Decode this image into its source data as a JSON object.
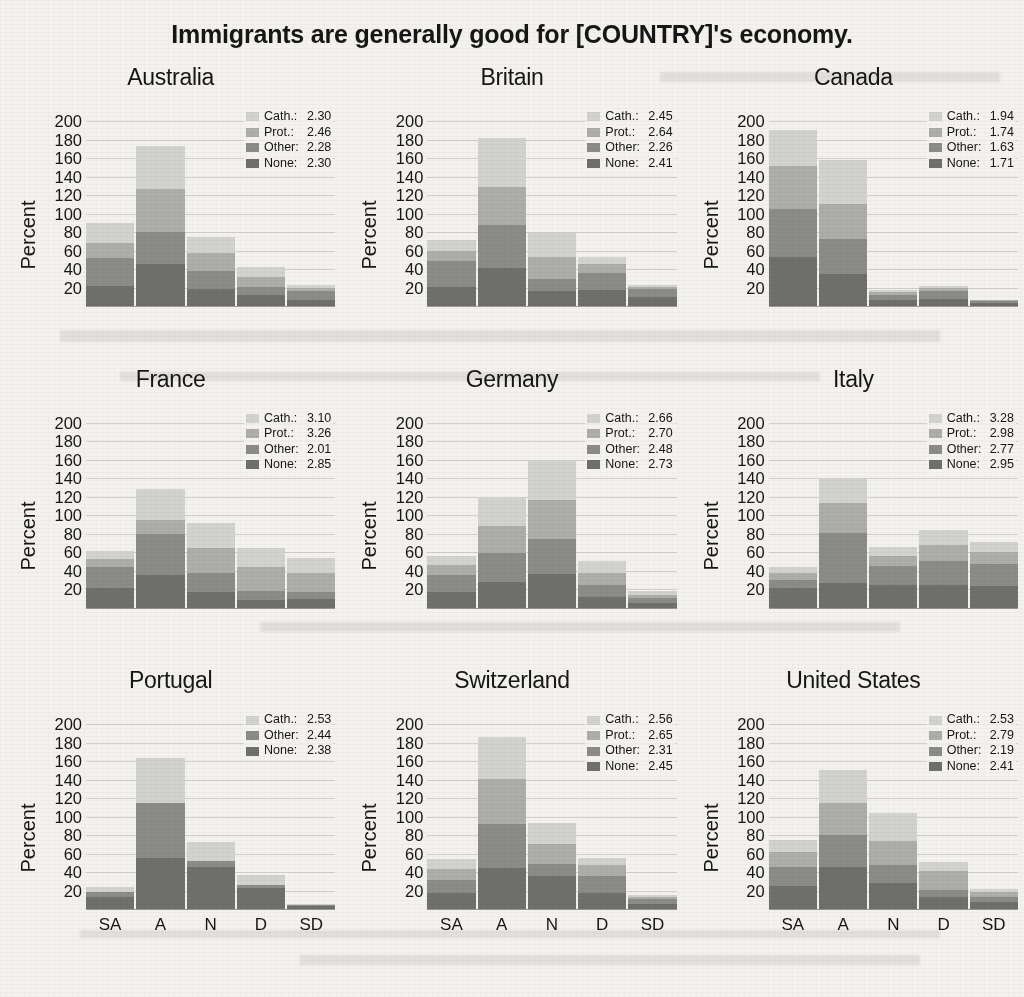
{
  "title": "Immigrants are generally good for [COUNTRY]'s economy.",
  "axis": {
    "ylabel": "Percent",
    "yticks": [
      200,
      180,
      160,
      140,
      120,
      100,
      80,
      60,
      40,
      20
    ],
    "ymax": 212,
    "xcategories": [
      "SA",
      "A",
      "N",
      "D",
      "SD"
    ]
  },
  "colors": {
    "cath": "#d2d2d0",
    "prot": "#adadab",
    "other": "#8b8b89",
    "none": "#6f6f6d",
    "background": "#f4f2ef",
    "text": "#161616"
  },
  "legend_labels": {
    "cath": "Cath.:",
    "prot": "Prot.:",
    "other": "Other:",
    "none": "None:"
  },
  "chart_data": {
    "type": "bar",
    "subtype": "stacked-bar-small-multiples",
    "title": "Immigrants are generally good for [COUNTRY]'s economy.",
    "xlabel": "",
    "ylabel": "Percent",
    "ylim": [
      0,
      212
    ],
    "grid": true,
    "legend_position": "top-right (inside each panel)",
    "categories": [
      "SA",
      "A",
      "N",
      "D",
      "SD"
    ],
    "series_order": [
      "None",
      "Other",
      "Prot.",
      "Cath."
    ],
    "panels": [
      {
        "name": "Australia",
        "legend": [
          {
            "name": "Cath.",
            "value": "2.30"
          },
          {
            "name": "Prot.",
            "value": "2.46"
          },
          {
            "name": "Other",
            "value": "2.28"
          },
          {
            "name": "None",
            "value": "2.30"
          }
        ],
        "series": [
          {
            "name": "None",
            "values": [
              22,
              45,
              18,
              12,
              7
            ]
          },
          {
            "name": "Other",
            "values": [
              30,
              35,
              20,
              9,
              9
            ]
          },
          {
            "name": "Prot.",
            "values": [
              16,
              47,
              19,
              10,
              4
            ]
          },
          {
            "name": "Cath.",
            "values": [
              22,
              46,
              18,
              11,
              3
            ]
          }
        ],
        "totals": [
          90,
          173,
          75,
          42,
          23
        ]
      },
      {
        "name": "Britain",
        "legend": [
          {
            "name": "Cath.",
            "value": "2.45"
          },
          {
            "name": "Prot.",
            "value": "2.64"
          },
          {
            "name": "Other",
            "value": "2.26"
          },
          {
            "name": "None",
            "value": "2.41"
          }
        ],
        "series": [
          {
            "name": "None",
            "values": [
              21,
              41,
              16,
              17,
              10
            ]
          },
          {
            "name": "Other",
            "values": [
              28,
              47,
              13,
              19,
              8
            ]
          },
          {
            "name": "Prot.",
            "values": [
              11,
              41,
              24,
              10,
              3
            ]
          },
          {
            "name": "Cath.",
            "values": [
              11,
              53,
              26,
              7,
              2
            ]
          }
        ],
        "totals": [
          71,
          182,
          79,
          53,
          23
        ]
      },
      {
        "name": "Canada",
        "legend": [
          {
            "name": "Cath.",
            "value": "1.94"
          },
          {
            "name": "Prot.",
            "value": "1.74"
          },
          {
            "name": "Other",
            "value": "1.63"
          },
          {
            "name": "None",
            "value": "1.71"
          }
        ],
        "series": [
          {
            "name": "None",
            "values": [
              53,
              35,
              6,
              8,
              3
            ]
          },
          {
            "name": "Other",
            "values": [
              52,
              38,
              6,
              8,
              2
            ]
          },
          {
            "name": "Prot.",
            "values": [
              46,
              37,
              3,
              4,
              1
            ]
          },
          {
            "name": "Cath.",
            "values": [
              39,
              48,
              2,
              2,
              1
            ]
          }
        ],
        "totals": [
          190,
          158,
          17,
          22,
          7
        ]
      },
      {
        "name": "France",
        "legend": [
          {
            "name": "Cath.",
            "value": "3.10"
          },
          {
            "name": "Prot.",
            "value": "3.26"
          },
          {
            "name": "Other",
            "value": "2.01"
          },
          {
            "name": "None",
            "value": "2.85"
          }
        ],
        "series": [
          {
            "name": "None",
            "values": [
              21,
              35,
              17,
              8,
              9
            ]
          },
          {
            "name": "Other",
            "values": [
              23,
              45,
              20,
              10,
              8
            ]
          },
          {
            "name": "Prot.",
            "values": [
              9,
              15,
              28,
              26,
              20
            ]
          },
          {
            "name": "Cath.",
            "values": [
              8,
              33,
              27,
              21,
              17
            ]
          }
        ],
        "totals": [
          61,
          128,
          92,
          65,
          54
        ]
      },
      {
        "name": "Germany",
        "legend": [
          {
            "name": "Cath.",
            "value": "2.66"
          },
          {
            "name": "Prot.",
            "value": "2.70"
          },
          {
            "name": "Other",
            "value": "2.48"
          },
          {
            "name": "None",
            "value": "2.73"
          }
        ],
        "series": [
          {
            "name": "None",
            "values": [
              17,
              28,
              36,
              12,
              5
            ]
          },
          {
            "name": "Other",
            "values": [
              18,
              31,
              38,
              13,
              5
            ]
          },
          {
            "name": "Prot.",
            "values": [
              11,
              29,
              43,
              13,
              4
            ]
          },
          {
            "name": "Cath.",
            "values": [
              10,
              31,
              43,
              12,
              4
            ]
          }
        ],
        "totals": [
          56,
          119,
          160,
          50,
          18
        ]
      },
      {
        "name": "Italy",
        "legend": [
          {
            "name": "Cath.",
            "value": "3.28"
          },
          {
            "name": "Prot.",
            "value": "2.98"
          },
          {
            "name": "Other",
            "value": "2.77"
          },
          {
            "name": "None",
            "value": "2.95"
          }
        ],
        "series": [
          {
            "name": "None",
            "values": [
              21,
              27,
              24,
              25,
              23
            ]
          },
          {
            "name": "Other",
            "values": [
              9,
              54,
              21,
              26,
              24
            ]
          },
          {
            "name": "Prot.",
            "values": [
              7,
              32,
              11,
              17,
              13
            ]
          },
          {
            "name": "Cath.",
            "values": [
              7,
              27,
              10,
              16,
              11
            ]
          }
        ],
        "totals": [
          44,
          140,
          66,
          84,
          71
        ]
      },
      {
        "name": "Portugal",
        "legend": [
          {
            "name": "Cath.",
            "value": "2.53"
          },
          {
            "name": "Other",
            "value": "2.44"
          },
          {
            "name": "None",
            "value": "2.38"
          }
        ],
        "series": [
          {
            "name": "None",
            "values": [
              13,
              56,
              46,
              23,
              4
            ]
          },
          {
            "name": "Other",
            "values": [
              6,
              59,
              6,
              3,
              1
            ]
          },
          {
            "name": "Prot.",
            "values": [
              0,
              0,
              0,
              0,
              0
            ]
          },
          {
            "name": "Cath.",
            "values": [
              5,
              49,
              21,
              11,
              1
            ]
          }
        ],
        "totals": [
          24,
          164,
          73,
          37,
          6
        ]
      },
      {
        "name": "Switzerland",
        "legend": [
          {
            "name": "Cath.",
            "value": "2.56"
          },
          {
            "name": "Prot.",
            "value": "2.65"
          },
          {
            "name": "Other",
            "value": "2.31"
          },
          {
            "name": "None",
            "value": "2.45"
          }
        ],
        "series": [
          {
            "name": "None",
            "values": [
              18,
              45,
              36,
              18,
              6
            ]
          },
          {
            "name": "Other",
            "values": [
              14,
              47,
              13,
              18,
              5
            ]
          },
          {
            "name": "Prot.",
            "values": [
              12,
              49,
              22,
              12,
              2
            ]
          },
          {
            "name": "Cath.",
            "values": [
              11,
              45,
              22,
              8,
              2
            ]
          }
        ],
        "totals": [
          55,
          186,
          93,
          56,
          15
        ]
      },
      {
        "name": "United States",
        "legend": [
          {
            "name": "Cath.",
            "value": "2.53"
          },
          {
            "name": "Prot.",
            "value": "2.79"
          },
          {
            "name": "Other",
            "value": "2.19"
          },
          {
            "name": "None",
            "value": "2.41"
          }
        ],
        "series": [
          {
            "name": "None",
            "values": [
              25,
              46,
              29,
              13,
              8
            ]
          },
          {
            "name": "Other",
            "values": [
              21,
              34,
              19,
              8,
              5
            ]
          },
          {
            "name": "Prot.",
            "values": [
              16,
              35,
              26,
              21,
              6
            ]
          },
          {
            "name": "Cath.",
            "values": [
              13,
              36,
              30,
              9,
              3
            ]
          }
        ],
        "totals": [
          75,
          151,
          104,
          51,
          22
        ]
      }
    ]
  }
}
